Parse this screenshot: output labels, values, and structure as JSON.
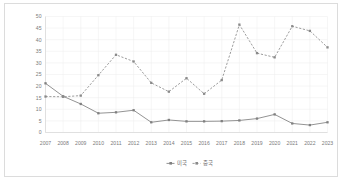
{
  "chart_data": {
    "type": "line",
    "title": "",
    "xlabel": "",
    "ylabel": "",
    "ylim": [
      0,
      50
    ],
    "ytick_step": 5,
    "grid": true,
    "legend_position": "bottom-center",
    "categories": [
      "2007",
      "2008",
      "2009",
      "2010",
      "2011",
      "2012",
      "2013",
      "2014",
      "2015",
      "2016",
      "2017",
      "2018",
      "2019",
      "2020",
      "2021",
      "2022",
      "2023"
    ],
    "yticks": [
      "0",
      "5",
      "10",
      "15",
      "20",
      "25",
      "30",
      "35",
      "40",
      "45",
      "50"
    ],
    "series": [
      {
        "name": "미국",
        "style": "solid",
        "color": "#808080",
        "marker": "square",
        "values": [
          21.2,
          15.6,
          12.3,
          8.3,
          8.7,
          9.6,
          4.4,
          5.4,
          4.8,
          4.8,
          4.9,
          5.2,
          6.0,
          7.8,
          3.9,
          3.2,
          4.4
        ]
      },
      {
        "name": "중국",
        "style": "dashed",
        "color": "#8a8a8a",
        "marker": "square",
        "values": [
          15.5,
          15.4,
          15.9,
          24.7,
          33.5,
          30.6,
          21.4,
          17.6,
          23.4,
          16.7,
          22.6,
          46.5,
          34.2,
          32.4,
          45.8,
          43.8,
          36.7
        ]
      }
    ]
  },
  "legend": {
    "items": [
      {
        "label": "미국"
      },
      {
        "label": "중국"
      }
    ]
  },
  "colors": {
    "series_usa": "#808080",
    "series_china": "#8a8a8a",
    "grid": "#ededed",
    "axis": "#d2d2d2",
    "tick_text": "#7a7a7a",
    "frame_border": "#dcdcdc",
    "background": "#ffffff"
  }
}
